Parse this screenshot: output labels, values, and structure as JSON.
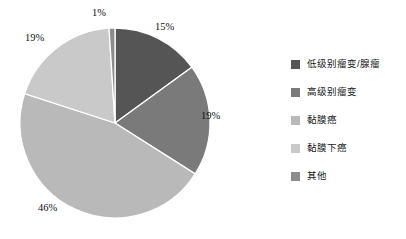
{
  "chart_data": {
    "type": "pie",
    "title": "",
    "subtitle": "",
    "xlabel": "",
    "ylabel": "",
    "grid": false,
    "legend_position": "right",
    "start_angle_deg": 0,
    "direction": "clockwise",
    "categories": [
      "低级别瘤变/腺瘤",
      "高级别瘤变",
      "黏膜癌",
      "黏膜下癌",
      "其他"
    ],
    "values": [
      15,
      19,
      46,
      19,
      1
    ],
    "labels": [
      "15%",
      "19%",
      "46%",
      "19%",
      "1%"
    ],
    "colors": [
      "#555555",
      "#7a7a7a",
      "#b9b9b9",
      "#c9c9c9",
      "#8c8c8c"
    ],
    "slices": [
      {
        "name": "低级别瘤变/腺瘤",
        "value": 15,
        "label": "15%",
        "color": "#555555"
      },
      {
        "name": "高级别瘤变",
        "value": 19,
        "label": "19%",
        "color": "#7a7a7a"
      },
      {
        "name": "黏膜癌",
        "value": 46,
        "label": "46%",
        "color": "#b9b9b9"
      },
      {
        "name": "黏膜下癌",
        "value": 19,
        "label": "19%",
        "color": "#c9c9c9"
      },
      {
        "name": "其他",
        "value": 1,
        "label": "1%",
        "color": "#8c8c8c"
      }
    ]
  },
  "legend": {
    "items": [
      {
        "label": "低级别瘤变/腺瘤",
        "color": "#555555"
      },
      {
        "label": "高级别瘤变",
        "color": "#7a7a7a"
      },
      {
        "label": "黏膜癌",
        "color": "#b9b9b9"
      },
      {
        "label": "黏膜下癌",
        "color": "#c9c9c9"
      },
      {
        "label": "其他",
        "color": "#8c8c8c"
      }
    ]
  },
  "slice_labels": {
    "low_grade": "15%",
    "high_grade": "19%",
    "mucosal_carcinoma": "46%",
    "submucosal_carcinoma": "19%",
    "other": "1%"
  }
}
